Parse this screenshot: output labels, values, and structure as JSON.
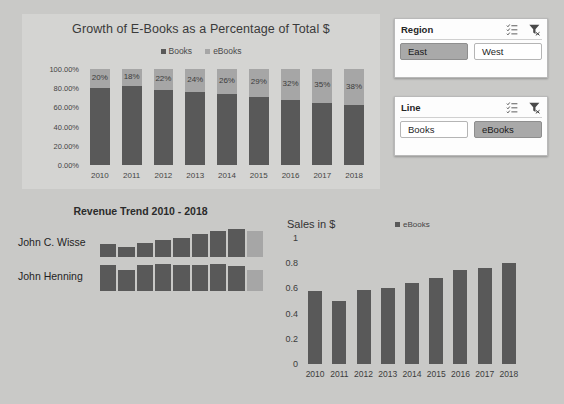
{
  "theme": {
    "page_bg": "#c9c9c7",
    "panel_bg": "#d4d4d2",
    "series_books": "#595959",
    "series_ebooks": "#a6a6a6",
    "slicer_bg": "#fdfdfd",
    "slicer_selected": "#a9a9a9"
  },
  "slicers": [
    {
      "name": "Region",
      "title": "Region",
      "multiselect_icon": "multi-select-icon",
      "clearfilter_icon": "clear-filter-icon",
      "items": [
        {
          "label": "East",
          "selected": true
        },
        {
          "label": "West",
          "selected": false
        }
      ]
    },
    {
      "name": "Line",
      "title": "Line",
      "multiselect_icon": "multi-select-icon",
      "clearfilter_icon": "clear-filter-icon",
      "items": [
        {
          "label": "Books",
          "selected": false
        },
        {
          "label": "eBooks",
          "selected": true
        }
      ]
    }
  ],
  "sparkline": {
    "title": "Revenue Trend 2010 - 2018",
    "rows": [
      {
        "label": "John C. Wisse",
        "values": [
          0.44,
          0.33,
          0.47,
          0.58,
          0.63,
          0.76,
          0.86,
          0.93,
          0.86
        ],
        "last_highlight": true
      },
      {
        "label": "John Henning",
        "values": [
          0.86,
          0.7,
          0.88,
          0.9,
          0.88,
          0.88,
          0.9,
          0.84,
          0.7
        ],
        "last_highlight": true
      }
    ]
  },
  "chart_data": [
    {
      "type": "bar",
      "name": "growth-of-ebooks",
      "title": "Growth of E-Books as a Percentage of Total $",
      "stacked": true,
      "categories": [
        "2010",
        "2011",
        "2012",
        "2013",
        "2014",
        "2015",
        "2016",
        "2017",
        "2018"
      ],
      "series": [
        {
          "name": "Books",
          "values": [
            80,
            82,
            78,
            76,
            74,
            71,
            68,
            65,
            62
          ],
          "color": "#595959"
        },
        {
          "name": "eBooks",
          "values": [
            20,
            18,
            22,
            24,
            26,
            29,
            32,
            35,
            38
          ],
          "color": "#a6a6a6"
        }
      ],
      "data_labels": [
        "20%",
        "18%",
        "22%",
        "24%",
        "26%",
        "29%",
        "32%",
        "35%",
        "38%"
      ],
      "ylabel": "",
      "xlabel": "",
      "ylim": [
        0,
        100
      ],
      "yticks": [
        "0.00%",
        "20.00%",
        "40.00%",
        "60.00%",
        "80.00%",
        "100.00%"
      ],
      "grid": false,
      "legend": [
        "Books",
        "eBooks"
      ],
      "legend_position": "top"
    },
    {
      "type": "bar",
      "name": "sales-in-dollars",
      "title": "Sales in $",
      "categories": [
        "2010",
        "2011",
        "2012",
        "2013",
        "2014",
        "2015",
        "2016",
        "2017",
        "2018"
      ],
      "series": [
        {
          "name": "eBooks",
          "values": [
            0.58,
            0.5,
            0.59,
            0.6,
            0.645,
            0.685,
            0.75,
            0.765,
            0.8
          ],
          "color": "#595959"
        }
      ],
      "ylabel": "",
      "xlabel": "",
      "ylim": [
        0,
        1
      ],
      "yticks": [
        "0",
        "0.2",
        "0.4",
        "0.6",
        "0.8",
        "1"
      ],
      "grid": false,
      "legend": [
        "eBooks"
      ],
      "legend_position": "top"
    }
  ]
}
